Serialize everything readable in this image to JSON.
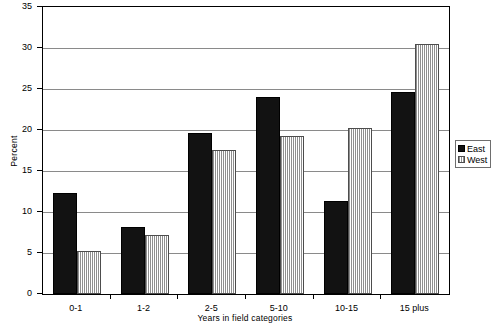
{
  "chart_data": {
    "type": "bar",
    "title": "",
    "subtitle": "",
    "xlabel": "Years in field categories",
    "ylabel": "Percent",
    "categories": [
      "0-1",
      "1-2",
      "2-5",
      "5-10",
      "10-15",
      "15 plus"
    ],
    "series": [
      {
        "name": "East",
        "values": [
          12.3,
          8.2,
          19.6,
          24.0,
          11.4,
          24.6
        ],
        "color": "#121212",
        "fill": "solid-black"
      },
      {
        "name": "West",
        "values": [
          5.3,
          7.2,
          17.6,
          19.3,
          20.2,
          30.5
        ],
        "color": "#8f8f8f",
        "fill": "vertical-hatch-gray"
      }
    ],
    "ylim": [
      0,
      35
    ],
    "ytick_values": [
      0,
      5,
      10,
      15,
      20,
      25,
      30,
      35
    ],
    "ytick_labels": [
      "0",
      "5",
      "10",
      "15",
      "20",
      "25",
      "30",
      "35"
    ],
    "grid": "horizontal",
    "grid_color": "#8a8a8a",
    "legend_position": "right",
    "legend_entries": [
      "East",
      "West"
    ],
    "plot_border_color": "#000000",
    "background": "#ffffff"
  }
}
